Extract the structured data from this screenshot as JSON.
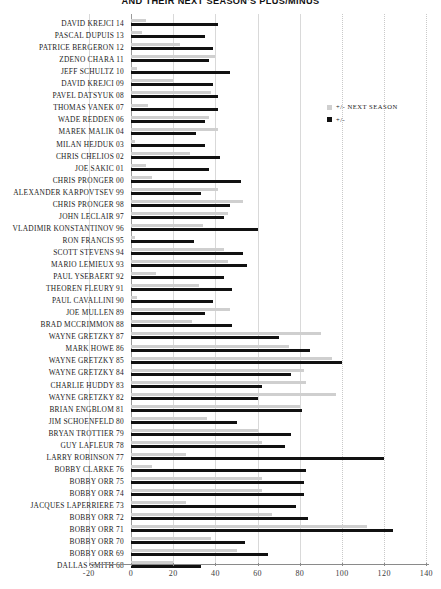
{
  "title": "AND THEIR NEXT SEASON'S PLUS/MINUS",
  "legend": {
    "position": "top-right",
    "items": [
      {
        "label": "+/- NEXT SEASON",
        "color": "#cfcfcf",
        "key": "next"
      },
      {
        "label": "+/-",
        "color": "#111111",
        "key": "current"
      }
    ]
  },
  "axis": {
    "x_ticks": [
      "-20",
      "0",
      "20",
      "40",
      "60",
      "80",
      "100",
      "120",
      "140"
    ],
    "x_min": -20,
    "x_max": 140,
    "grid": true
  },
  "chart_data": {
    "type": "bar",
    "orientation": "horizontal",
    "title": "AND THEIR NEXT SEASON'S PLUS/MINUS",
    "xlabel": "",
    "ylabel": "",
    "xlim": [
      -20,
      140
    ],
    "grid": true,
    "legend_position": "top-right",
    "series": [
      {
        "name": "+/-",
        "color": "#111111"
      },
      {
        "name": "+/- NEXT SEASON",
        "color": "#cfcfcf"
      }
    ],
    "categories": [
      "DAVID KREJCI 14",
      "PASCAL DUPUIS 13",
      "PATRICE BERGERON 12",
      "ZDENO CHARA 11",
      "JEFF SCHULTZ 10",
      "DAVID KREJCI 09",
      "PAVEL DATSYUK 08",
      "THOMAS VANEK 07",
      "WADE REDDEN 06",
      "MAREK MALIK 04",
      "MILAN HEJDUK 03",
      "CHRIS CHELIOS 02",
      "JOE SAKIC 01",
      "CHRIS PRONGER 00",
      "ALEXANDER KARPOVTSEV 99",
      "CHRIS PRONGER 98",
      "JOHN LECLAIR 97",
      "VLADIMIR KONSTANTINOV 96",
      "RON FRANCIS 95",
      "SCOTT STEVENS 94",
      "MARIO LEMIEUX 93",
      "PAUL YSEBAERT 92",
      "THEOREN FLEURY 91",
      "PAUL CAVALLINI 90",
      "JOE MULLEN 89",
      "BRAD MCCRIMMON 88",
      "WAYNE GRETZKY 87",
      "MARK HOWE 86",
      "WAYNE GRETZKY 85",
      "WAYNE GRETZKY 84",
      "CHARLIE HUDDY 83",
      "WAYNE GRETZKY 82",
      "BRIAN ENGBLOM 81",
      "JIM SCHOENFELD 80",
      "BRYAN TROTTIER 79",
      "GUY LAFLEUR 78",
      "LARRY ROBINSON 77",
      "BOBBY CLARKE 76",
      "BOBBY ORR 75",
      "BOBBY ORR 74",
      "JACQUES LAPERRIERE 73",
      "BOBBY ORR 72",
      "BOBBY ORR 71",
      "BOBBY ORR 70",
      "BOBBY ORR 69",
      "DALLAS SMITH 68"
    ],
    "values_current": [
      41,
      35,
      39,
      37,
      47,
      39,
      41,
      41,
      35,
      31,
      35,
      42,
      37,
      52,
      33,
      47,
      44,
      60,
      30,
      53,
      55,
      44,
      48,
      39,
      35,
      48,
      70,
      85,
      100,
      76,
      62,
      60,
      81,
      50,
      76,
      73,
      120,
      83,
      82,
      82,
      78,
      84,
      124,
      54,
      65,
      33
    ],
    "values_next": [
      7,
      5,
      23,
      40,
      3,
      20,
      38,
      8,
      37,
      41,
      2,
      28,
      7,
      10,
      41,
      53,
      46,
      34,
      2,
      44,
      46,
      12,
      32,
      3,
      47,
      29,
      90,
      75,
      95,
      82,
      83,
      97,
      80,
      36,
      60,
      62,
      26,
      10,
      62,
      62,
      26,
      67,
      112,
      38,
      50,
      20
    ]
  },
  "rows": [
    {
      "label": "DAVID KREJCI 14",
      "cur": 41,
      "next": 7
    },
    {
      "label": "PASCAL DUPUIS 13",
      "cur": 35,
      "next": 5
    },
    {
      "label": "PATRICE BERGERON 12",
      "cur": 39,
      "next": 23
    },
    {
      "label": "ZDENO CHARA 11",
      "cur": 37,
      "next": 40
    },
    {
      "label": "JEFF SCHULTZ 10",
      "cur": 47,
      "next": 3
    },
    {
      "label": "DAVID KREJCI 09",
      "cur": 39,
      "next": 20
    },
    {
      "label": "PAVEL DATSYUK 08",
      "cur": 41,
      "next": 38
    },
    {
      "label": "THOMAS VANEK 07",
      "cur": 41,
      "next": 8
    },
    {
      "label": "WADE REDDEN 06",
      "cur": 35,
      "next": 37
    },
    {
      "label": "MAREK MALIK 04",
      "cur": 31,
      "next": 41
    },
    {
      "label": "MILAN HEJDUK 03",
      "cur": 35,
      "next": 2
    },
    {
      "label": "CHRIS CHELIOS 02",
      "cur": 42,
      "next": 28
    },
    {
      "label": "JOE SAKIC 01",
      "cur": 37,
      "next": 7
    },
    {
      "label": "CHRIS PRONGER 00",
      "cur": 52,
      "next": 10
    },
    {
      "label": "ALEXANDER KARPOVTSEV 99",
      "cur": 33,
      "next": 41
    },
    {
      "label": "CHRIS PRONGER 98",
      "cur": 47,
      "next": 53
    },
    {
      "label": "JOHN LECLAIR 97",
      "cur": 44,
      "next": 46
    },
    {
      "label": "VLADIMIR KONSTANTINOV 96",
      "cur": 60,
      "next": 34
    },
    {
      "label": "RON FRANCIS 95",
      "cur": 30,
      "next": 2
    },
    {
      "label": "SCOTT STEVENS 94",
      "cur": 53,
      "next": 44
    },
    {
      "label": "MARIO LEMIEUX 93",
      "cur": 55,
      "next": 46
    },
    {
      "label": "PAUL YSEBAERT 92",
      "cur": 44,
      "next": 12
    },
    {
      "label": "THEOREN FLEURY 91",
      "cur": 48,
      "next": 32
    },
    {
      "label": "PAUL CAVALLINI 90",
      "cur": 39,
      "next": 3
    },
    {
      "label": "JOE MULLEN 89",
      "cur": 35,
      "next": 47
    },
    {
      "label": "BRAD MCCRIMMON 88",
      "cur": 48,
      "next": 29
    },
    {
      "label": "WAYNE GRETZKY 87",
      "cur": 70,
      "next": 90
    },
    {
      "label": "MARK HOWE 86",
      "cur": 85,
      "next": 75
    },
    {
      "label": "WAYNE GRETZKY 85",
      "cur": 100,
      "next": 95
    },
    {
      "label": "WAYNE GRETZKY 84",
      "cur": 76,
      "next": 82
    },
    {
      "label": "CHARLIE HUDDY 83",
      "cur": 62,
      "next": 83
    },
    {
      "label": "WAYNE GRETZKY 82",
      "cur": 60,
      "next": 97
    },
    {
      "label": "BRIAN ENGBLOM 81",
      "cur": 81,
      "next": 80
    },
    {
      "label": "JIM SCHOENFELD 80",
      "cur": 50,
      "next": 36
    },
    {
      "label": "BRYAN TROTTIER 79",
      "cur": 76,
      "next": 60
    },
    {
      "label": "GUY LAFLEUR 78",
      "cur": 73,
      "next": 62
    },
    {
      "label": "LARRY ROBINSON 77",
      "cur": 120,
      "next": 26
    },
    {
      "label": "BOBBY CLARKE 76",
      "cur": 83,
      "next": 10
    },
    {
      "label": "BOBBY ORR 75",
      "cur": 82,
      "next": 62
    },
    {
      "label": "BOBBY ORR 74",
      "cur": 82,
      "next": 62
    },
    {
      "label": "JACQUES LAPERRIERE 73",
      "cur": 78,
      "next": 26
    },
    {
      "label": "BOBBY ORR 72",
      "cur": 84,
      "next": 67
    },
    {
      "label": "BOBBY ORR 71",
      "cur": 124,
      "next": 112
    },
    {
      "label": "BOBBY ORR 70",
      "cur": 54,
      "next": 38
    },
    {
      "label": "BOBBY ORR 69",
      "cur": 65,
      "next": 50
    },
    {
      "label": "DALLAS SMITH 68",
      "cur": 33,
      "next": 20
    }
  ]
}
